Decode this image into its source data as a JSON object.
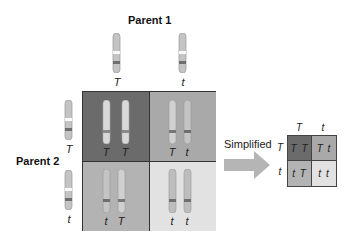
{
  "labels": {
    "parent1": "Parent 1",
    "parent2": "Parent 2",
    "simplified": "Simplified"
  },
  "parent1_alleles": [
    "T",
    "t"
  ],
  "parent2_alleles": [
    "T",
    "t"
  ],
  "punnett": {
    "cells": [
      {
        "row": 0,
        "col": 0,
        "alleles": [
          "T",
          "T"
        ],
        "color": "#6b6b6b"
      },
      {
        "row": 0,
        "col": 1,
        "alleles": [
          "T",
          "t"
        ],
        "color": "#a9a9a9"
      },
      {
        "row": 1,
        "col": 0,
        "alleles": [
          "t",
          "T"
        ],
        "color": "#b3b3b3"
      },
      {
        "row": 1,
        "col": 1,
        "alleles": [
          "t",
          "t"
        ],
        "color": "#e2e2e2"
      }
    ]
  },
  "simplified_grid": {
    "col_headers": [
      "T",
      "t"
    ],
    "row_headers": [
      "T",
      "t"
    ],
    "cells": [
      "TT",
      "Tt",
      "tT",
      "tt"
    ]
  },
  "colors": {
    "chromosome": "#c4c4c4",
    "chromosome_light": "#d9d9d9",
    "band": "#6e6e6e",
    "arrow": "#b5b5b5"
  }
}
